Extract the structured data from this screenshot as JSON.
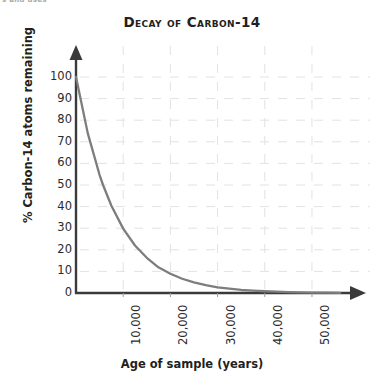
{
  "figure": {
    "crop_fragment": "s and uses",
    "title": "Decay of Carbon-14"
  },
  "chart_data": {
    "type": "line",
    "title": "Decay of Carbon-14",
    "xlabel": "Age of sample (years)",
    "ylabel": "% Carbon-14 atoms remaining",
    "xlim": [
      0,
      57000
    ],
    "ylim": [
      0,
      100
    ],
    "grid": true,
    "grid_style": "dashed",
    "legend": "none",
    "axis_arrows": true,
    "xticks": [
      10000,
      20000,
      30000,
      40000,
      50000
    ],
    "xtick_labels": [
      "10,000",
      "20,000",
      "30,000",
      "40,000",
      "50,000"
    ],
    "xtick_rotation": 90,
    "yticks": [
      0,
      10,
      20,
      30,
      40,
      50,
      60,
      70,
      80,
      90,
      100
    ],
    "ytick_labels": [
      "0",
      "10",
      "20",
      "30",
      "40",
      "50",
      "60",
      "70",
      "80",
      "90",
      "100"
    ],
    "half_life_years": 5730,
    "series": [
      {
        "name": "% Carbon-14 remaining",
        "color": "#7d7d7d",
        "x": [
          0,
          2500,
          5000,
          5730,
          7500,
          10000,
          12500,
          15000,
          17460,
          20000,
          22500,
          25000,
          27500,
          30000,
          32500,
          35000,
          37500,
          40000,
          42500,
          45000,
          47500,
          50000,
          53000,
          56000
        ],
        "values": [
          100,
          73.9,
          54.6,
          50,
          40.4,
          29.8,
          22,
          16.3,
          11.9,
          8.9,
          6.6,
          4.9,
          3.6,
          2.6,
          2,
          1.4,
          1.1,
          0.8,
          0.6,
          0.4,
          0.3,
          0.2,
          0.2,
          0.1
        ]
      }
    ]
  },
  "colors": {
    "axis": "#3a3a3a",
    "curve": "#7d7d7d",
    "grid": "#e2e2e2",
    "text": "#231f20",
    "background": "#ffffff"
  }
}
